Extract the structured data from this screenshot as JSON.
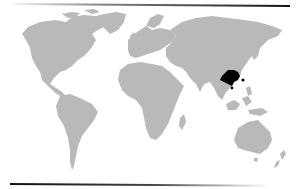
{
  "map": {
    "type": "world-choropleth",
    "caption": "World map highlighting Southern China region",
    "base_color": "#b9b9b9",
    "highlight_color": "#000000",
    "background": "#ffffff",
    "highlighted_regions": [
      "Southern China (Guangdong / Guangxi)",
      "Hainan",
      "Taiwan"
    ],
    "continents": [
      "North America",
      "Greenland",
      "South America",
      "Europe",
      "Africa",
      "Asia",
      "Australia",
      "New Zealand"
    ]
  }
}
